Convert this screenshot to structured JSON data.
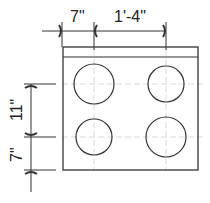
{
  "diagram": {
    "dimensions": {
      "left_offset": "7\"",
      "burner_spacing_horizontal": "1'-4\"",
      "burner_spacing_vertical": "11\"",
      "bottom_offset": "7\""
    },
    "burners": [
      "top-left",
      "top-right",
      "bottom-left",
      "bottom-right"
    ]
  }
}
